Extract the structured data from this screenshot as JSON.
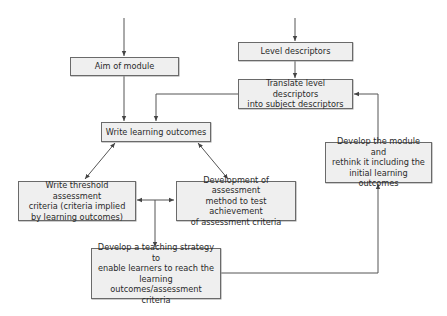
{
  "diagram": {
    "type": "flowchart",
    "nodes": [
      {
        "id": "aim",
        "label": "Aim of module"
      },
      {
        "id": "level",
        "label": "Level descriptors"
      },
      {
        "id": "translate",
        "label": "Translate level descriptors\ninto subject descriptors"
      },
      {
        "id": "outcomes",
        "label": "Write learning outcomes"
      },
      {
        "id": "threshold",
        "label": "Write threshold assessment\ncriteria (criteria implied\nby learning outcomes)"
      },
      {
        "id": "assessment",
        "label": "Development of assessment\nmethod to test achievement\nof assessment criteria"
      },
      {
        "id": "teaching",
        "label": "Develop a teaching strategy to\nenable learners to reach the\nlearning outcomes/assessment\ncriteria"
      },
      {
        "id": "rethink",
        "label": "Develop the module and\nrethink it including the\ninitial learning outcomes"
      }
    ],
    "edges": [
      {
        "from": "(entry)",
        "to": "aim",
        "direction": "forward"
      },
      {
        "from": "(entry)",
        "to": "level",
        "direction": "forward"
      },
      {
        "from": "level",
        "to": "translate",
        "direction": "forward"
      },
      {
        "from": "aim",
        "to": "outcomes",
        "direction": "forward"
      },
      {
        "from": "translate",
        "to": "outcomes",
        "direction": "forward"
      },
      {
        "from": "outcomes",
        "to": "threshold",
        "direction": "both"
      },
      {
        "from": "outcomes",
        "to": "assessment",
        "direction": "both"
      },
      {
        "from": "threshold",
        "to": "assessment",
        "direction": "both"
      },
      {
        "from": "threshold-assessment-link",
        "to": "teaching",
        "direction": "forward"
      },
      {
        "from": "teaching",
        "to": "rethink",
        "direction": "forward"
      },
      {
        "from": "rethink",
        "to": "translate",
        "direction": "forward"
      }
    ]
  },
  "colors": {
    "box_fill": "#efefef",
    "box_border": "#6a6a6a",
    "line": "#555555",
    "text": "#2a2a2a"
  }
}
